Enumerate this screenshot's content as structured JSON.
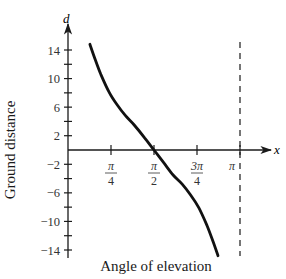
{
  "chart_data": {
    "type": "line",
    "title": "",
    "xlabel": "Angle of elevation",
    "ylabel": "Ground distance",
    "x_axis_symbol": "x",
    "y_axis_symbol": "d",
    "x_ticks": [
      {
        "value": 0.7854,
        "label_num": "π",
        "label_den": "4"
      },
      {
        "value": 1.5708,
        "label_num": "π",
        "label_den": "2"
      },
      {
        "value": 2.3562,
        "label_num": "3π",
        "label_den": "4"
      },
      {
        "value": 3.1416,
        "label_num": "π",
        "label_den": ""
      }
    ],
    "y_ticks": [
      14,
      12,
      10,
      8,
      6,
      4,
      2,
      -2,
      -4,
      -6,
      -8,
      -10,
      -12,
      -14
    ],
    "y_tick_labels": [
      "14",
      "10",
      "6",
      "2",
      "−2",
      "−6",
      "−10",
      "−14"
    ],
    "y_tick_label_values": [
      14,
      10,
      6,
      2,
      -2,
      -6,
      -10,
      -14
    ],
    "xlim": [
      0,
      3.5
    ],
    "ylim": [
      -15,
      16
    ],
    "grid": false,
    "legend": null,
    "asymptote": {
      "x": 3.1416,
      "style": "dashed"
    },
    "series": [
      {
        "name": "ground distance",
        "x": [
          0.4,
          0.5,
          0.6,
          0.75,
          0.9,
          1.05,
          1.21,
          1.4,
          1.5708,
          1.74,
          1.92,
          2.09,
          2.24,
          2.39,
          2.54,
          2.64,
          2.74
        ],
        "y": [
          14.8,
          12.6,
          10.6,
          8.1,
          6.3,
          4.8,
          3.5,
          1.7,
          0,
          -1.7,
          -3.5,
          -4.8,
          -6.3,
          -8.1,
          -10.6,
          -12.6,
          -14.8
        ]
      }
    ]
  },
  "labels": {
    "xlabel": "Angle of elevation",
    "ylabel": "Ground distance",
    "x_symbol": "x",
    "y_symbol": "d"
  }
}
